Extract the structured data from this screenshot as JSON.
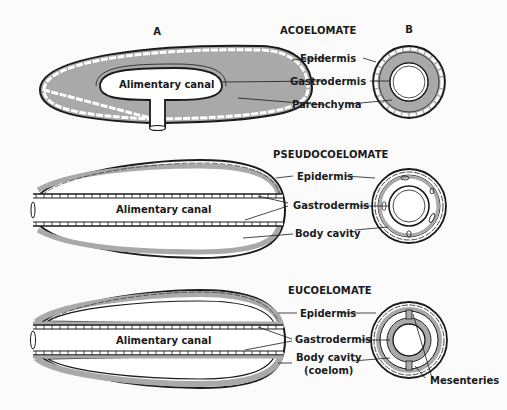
{
  "figure": {
    "column_headers": {
      "a": "A",
      "b": "B"
    },
    "panels": [
      {
        "title": "ACOELOMATE",
        "canal_label": "Alimentary canal",
        "labels": [
          "Epidermis",
          "Gastrodermis",
          "Parenchyma"
        ]
      },
      {
        "title": "PSEUDOCOELOMATE",
        "canal_label": "Alimentary canal",
        "labels": [
          "Epidermis",
          "Gastrodermis",
          "Body cavity"
        ]
      },
      {
        "title": "EUCOELOMATE",
        "canal_label": "Alimentary canal",
        "labels": [
          "Epidermis",
          "Gastrodermis",
          "Body cavity",
          "(coelom)",
          "Mesenteries"
        ]
      }
    ],
    "colors": {
      "tissue_fill": "#a9a9a9",
      "outline": "#1a1a1a",
      "background": "#fbfbfb"
    }
  }
}
